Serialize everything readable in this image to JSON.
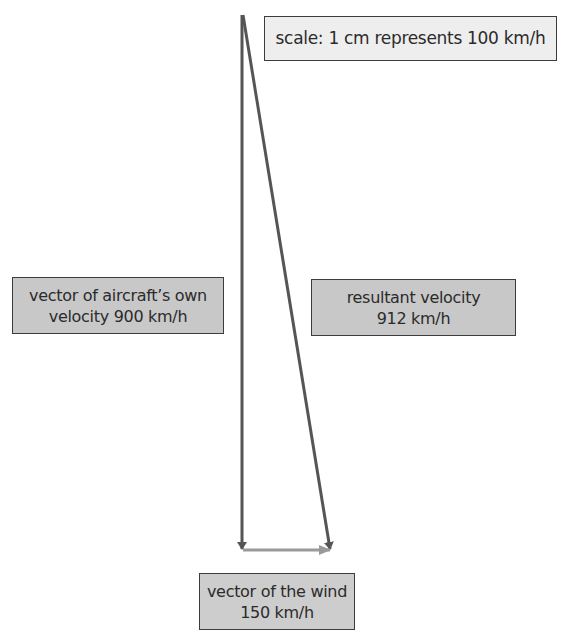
{
  "diagram": {
    "scale_label": "scale: 1 cm represents 100 km/h",
    "labels": {
      "own_velocity": {
        "line1": "vector of aircraft’s own",
        "line2": "velocity 900 km/h"
      },
      "resultant": {
        "line1": "resultant velocity",
        "line2": "912 km/h"
      },
      "wind": {
        "line1": "vector of the wind",
        "line2": "150 km/h"
      }
    },
    "vectors": [
      {
        "name": "aircraft own velocity",
        "magnitude_kmh": 900,
        "direction": "down",
        "color": "#555555"
      },
      {
        "name": "wind",
        "magnitude_kmh": 150,
        "direction": "right",
        "color": "#9a9a9a"
      },
      {
        "name": "resultant velocity",
        "magnitude_kmh": 912,
        "direction": "down-right",
        "color": "#555555"
      }
    ],
    "colors": {
      "dark_vector": "#555555",
      "wind_vector": "#9a9a9a",
      "label_fill": "#c8c8c8",
      "scale_fill": "#eeeeee",
      "border": "#3c3c3c"
    }
  }
}
